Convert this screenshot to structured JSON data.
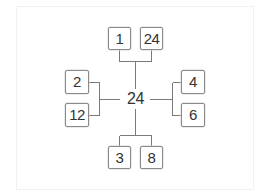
{
  "diagram": {
    "type": "factor-tree",
    "center": {
      "value": "24"
    },
    "branches": {
      "top": {
        "factors": [
          "1",
          "24"
        ]
      },
      "left": {
        "factors": [
          "2",
          "12"
        ]
      },
      "right": {
        "factors": [
          "4",
          "6"
        ]
      },
      "bottom": {
        "factors": [
          "3",
          "8"
        ]
      }
    },
    "colors": {
      "line": "#7a7a7a",
      "box_border": "#8a8a8a",
      "text": "#333333",
      "background": "#ffffff"
    }
  }
}
